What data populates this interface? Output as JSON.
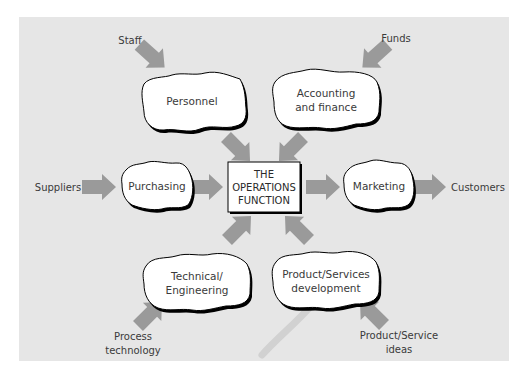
{
  "diagram": {
    "background_color": "#e6e6e6",
    "arrow_color": "#9a9a9a",
    "center": {
      "line1": "THE",
      "line2": "OPERATIONS",
      "line3": "FUNCTION"
    },
    "departments": {
      "personnel": {
        "line1": "Personnel"
      },
      "accounting": {
        "line1": "Accounting",
        "line2": "and finance"
      },
      "purchasing": {
        "line1": "Purchasing"
      },
      "marketing": {
        "line1": "Marketing"
      },
      "technical": {
        "line1": "Technical/",
        "line2": "Engineering"
      },
      "product_dev": {
        "line1": "Product/Services",
        "line2": "development"
      }
    },
    "external": {
      "staff": {
        "line1": "Staff"
      },
      "funds": {
        "line1": "Funds"
      },
      "suppliers": {
        "line1": "Suppliers"
      },
      "customers": {
        "line1": "Customers"
      },
      "process_technology": {
        "line1": "Process",
        "line2": "technology"
      },
      "product_ideas": {
        "line1": "Product/Service",
        "line2": "ideas"
      }
    }
  }
}
